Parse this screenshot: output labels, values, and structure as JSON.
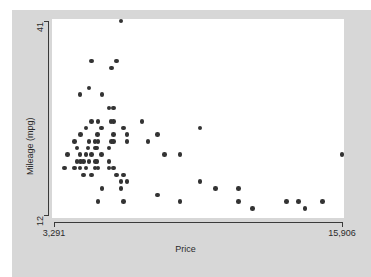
{
  "chart_data": {
    "type": "scatter",
    "title": "",
    "xlabel": "Price",
    "ylabel": "Mileage (mpg)",
    "xlim": [
      3291,
      15906
    ],
    "ylim": [
      12,
      41
    ],
    "xticks": [
      3291,
      15906
    ],
    "xtick_labels": [
      "3,291",
      "15,906"
    ],
    "yticks": [
      12,
      41
    ],
    "ytick_labels": [
      "12",
      "41"
    ],
    "grid": false,
    "legend": false,
    "marker_color": "#333333",
    "marker_shape": "circle",
    "background_color": "#d7d7d7",
    "plot_background_color": "#ffffff",
    "axis_color": "#3a3a3a",
    "n_points": 74,
    "points": [
      {
        "x": 6229,
        "y": 41
      },
      {
        "x": 4934,
        "y": 35
      },
      {
        "x": 6040,
        "y": 35
      },
      {
        "x": 5799,
        "y": 34
      },
      {
        "x": 4816,
        "y": 31
      },
      {
        "x": 5397,
        "y": 30
      },
      {
        "x": 4424,
        "y": 30
      },
      {
        "x": 5705,
        "y": 28
      },
      {
        "x": 5899,
        "y": 28
      },
      {
        "x": 4934,
        "y": 26
      },
      {
        "x": 5222,
        "y": 26
      },
      {
        "x": 5788,
        "y": 26
      },
      {
        "x": 5899,
        "y": 26
      },
      {
        "x": 7140,
        "y": 26
      },
      {
        "x": 4697,
        "y": 25
      },
      {
        "x": 5379,
        "y": 25
      },
      {
        "x": 6342,
        "y": 25
      },
      {
        "x": 9690,
        "y": 25
      },
      {
        "x": 4452,
        "y": 24
      },
      {
        "x": 5189,
        "y": 24
      },
      {
        "x": 5886,
        "y": 24
      },
      {
        "x": 6486,
        "y": 24
      },
      {
        "x": 7827,
        "y": 24
      },
      {
        "x": 4187,
        "y": 23
      },
      {
        "x": 4816,
        "y": 23
      },
      {
        "x": 5079,
        "y": 23
      },
      {
        "x": 5222,
        "y": 23
      },
      {
        "x": 5799,
        "y": 23
      },
      {
        "x": 5886,
        "y": 23
      },
      {
        "x": 6486,
        "y": 23
      },
      {
        "x": 7402,
        "y": 23
      },
      {
        "x": 4296,
        "y": 22
      },
      {
        "x": 4782,
        "y": 22
      },
      {
        "x": 5104,
        "y": 22
      },
      {
        "x": 5172,
        "y": 22
      },
      {
        "x": 5705,
        "y": 22
      },
      {
        "x": 3895,
        "y": 21
      },
      {
        "x": 4424,
        "y": 21
      },
      {
        "x": 4697,
        "y": 21
      },
      {
        "x": 4934,
        "y": 21
      },
      {
        "x": 5379,
        "y": 21
      },
      {
        "x": 8129,
        "y": 21
      },
      {
        "x": 8814,
        "y": 21
      },
      {
        "x": 15906,
        "y": 21
      },
      {
        "x": 4296,
        "y": 20
      },
      {
        "x": 4452,
        "y": 20
      },
      {
        "x": 4589,
        "y": 20
      },
      {
        "x": 4816,
        "y": 20
      },
      {
        "x": 5104,
        "y": 20
      },
      {
        "x": 5172,
        "y": 20
      },
      {
        "x": 5705,
        "y": 20
      },
      {
        "x": 3748,
        "y": 19
      },
      {
        "x": 4187,
        "y": 19
      },
      {
        "x": 4424,
        "y": 19
      },
      {
        "x": 4697,
        "y": 19
      },
      {
        "x": 5079,
        "y": 19
      },
      {
        "x": 5222,
        "y": 19
      },
      {
        "x": 5705,
        "y": 19
      },
      {
        "x": 5899,
        "y": 19
      },
      {
        "x": 4589,
        "y": 18
      },
      {
        "x": 4934,
        "y": 18
      },
      {
        "x": 6040,
        "y": 18
      },
      {
        "x": 6342,
        "y": 18
      },
      {
        "x": 6229,
        "y": 17
      },
      {
        "x": 6486,
        "y": 17
      },
      {
        "x": 9690,
        "y": 17
      },
      {
        "x": 5397,
        "y": 16
      },
      {
        "x": 6229,
        "y": 16
      },
      {
        "x": 10372,
        "y": 16
      },
      {
        "x": 11385,
        "y": 16
      },
      {
        "x": 7827,
        "y": 15
      },
      {
        "x": 5222,
        "y": 14
      },
      {
        "x": 6342,
        "y": 14
      },
      {
        "x": 8814,
        "y": 14
      },
      {
        "x": 11385,
        "y": 14
      },
      {
        "x": 13466,
        "y": 14
      },
      {
        "x": 13995,
        "y": 14
      },
      {
        "x": 15044,
        "y": 14
      },
      {
        "x": 11995,
        "y": 13
      },
      {
        "x": 14280,
        "y": 13
      }
    ]
  }
}
